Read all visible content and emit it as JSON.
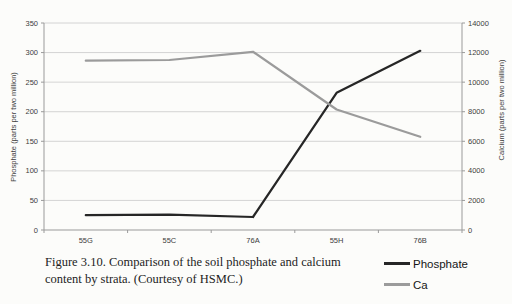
{
  "chart_data": {
    "type": "line",
    "categories": [
      "55G",
      "55C",
      "76A",
      "55H",
      "76B"
    ],
    "series": [
      {
        "name": "Phosphate",
        "axis": "left",
        "color": "#262626",
        "values": [
          25,
          26,
          22,
          232,
          303
        ]
      },
      {
        "name": "Ca",
        "axis": "right",
        "color": "#9b9b9b",
        "values": [
          11450,
          11500,
          12050,
          8150,
          6300
        ]
      }
    ],
    "left_axis": {
      "label": "Phosphate (parts per two million)",
      "ticks": [
        0,
        50,
        100,
        150,
        200,
        250,
        300,
        350
      ],
      "ylim": [
        0,
        350
      ]
    },
    "right_axis": {
      "label": "Calcium (parts per two million)",
      "ticks": [
        0,
        2000,
        4000,
        6000,
        8000,
        10000,
        12000,
        14000
      ],
      "ylim": [
        0,
        14000
      ]
    },
    "x_axis": {
      "tick_labels": [
        "55G",
        "55C",
        "76A",
        "55H",
        "76B"
      ]
    },
    "grid": true,
    "legend_position": "bottom-right"
  },
  "legend": {
    "items": [
      {
        "label": "Phosphate",
        "color": "#262626"
      },
      {
        "label": "Ca",
        "color": "#9b9b9b"
      }
    ]
  },
  "caption": {
    "line1": "Figure 3.10. Comparison of the soil phosphate and calcium",
    "line2": "content by strata. (Courtesy of HSMC.)"
  },
  "colors": {
    "page_background": "#fcfcfa",
    "gridline": "#c9c9c9",
    "axis": "#9a9a9a",
    "tick_text": "#3c3c3c"
  }
}
